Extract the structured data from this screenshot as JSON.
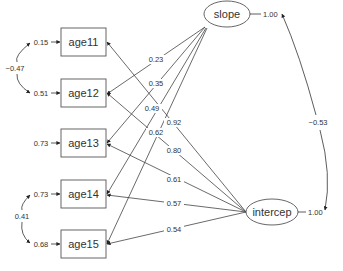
{
  "diagram": {
    "type": "structural-equation-path-diagram",
    "observed": [
      {
        "id": "age11",
        "label": "age11",
        "error_variance": "0.15"
      },
      {
        "id": "age12",
        "label": "age12",
        "error_variance": "0.51"
      },
      {
        "id": "age13",
        "label": "age13",
        "error_variance": "0.73"
      },
      {
        "id": "age14",
        "label": "age14",
        "error_variance": "0.73"
      },
      {
        "id": "age15",
        "label": "age15",
        "error_variance": "0.68"
      }
    ],
    "latent": [
      {
        "id": "slope",
        "label": "slope",
        "variance": "1.00"
      },
      {
        "id": "intercep",
        "label": "intercep",
        "variance": "1.00"
      }
    ],
    "slope_loadings": [
      {
        "to": "age11",
        "value": "0.23"
      },
      {
        "to": "age12",
        "value": "0.35"
      },
      {
        "to": "age13",
        "value": "0.49"
      },
      {
        "to": "age14",
        "value": "0.62"
      },
      {
        "to": "age15",
        "value": "0.62"
      }
    ],
    "intercept_loadings": [
      {
        "to": "age11",
        "value": "0.92"
      },
      {
        "to": "age12",
        "value": "0.80"
      },
      {
        "to": "age13",
        "value": "0.61"
      },
      {
        "to": "age14",
        "value": "0.57"
      },
      {
        "to": "age15",
        "value": "0.54"
      }
    ],
    "covariances": [
      {
        "between": [
          "age11",
          "age12"
        ],
        "value": "−0.47"
      },
      {
        "between": [
          "age14",
          "age15"
        ],
        "value": "0.41"
      },
      {
        "between": [
          "slope",
          "intercep"
        ],
        "value": "−0.53"
      }
    ],
    "colors": {
      "line": "#333333",
      "text": "#333333",
      "background": "#ffffff"
    }
  }
}
